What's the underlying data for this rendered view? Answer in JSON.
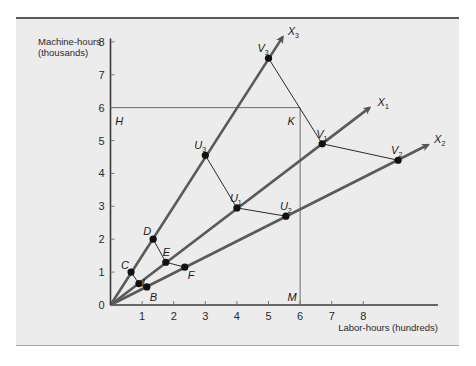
{
  "chart_data": {
    "type": "line",
    "title": "",
    "xlabel": "Labor-hours (hundreds)",
    "ylabel": "Machine-hours (thousands)",
    "ylabel_line1": "Machine-hours",
    "ylabel_line2": "(thousands)",
    "xlim": [
      0,
      10.5
    ],
    "ylim": [
      0,
      8
    ],
    "x_ticks": [
      1,
      2,
      3,
      4,
      5,
      6,
      7,
      8
    ],
    "y_ticks": [
      0,
      1,
      2,
      3,
      4,
      5,
      6,
      7,
      8
    ],
    "grid": false,
    "rays": [
      {
        "name": "X1",
        "label": "X",
        "sub": "1",
        "from": [
          0,
          0
        ],
        "to": [
          8.2,
          6.0
        ]
      },
      {
        "name": "X2",
        "label": "X",
        "sub": "2",
        "from": [
          0,
          0
        ],
        "to": [
          10.05,
          4.87
        ]
      },
      {
        "name": "X3",
        "label": "X",
        "sub": "3",
        "from": [
          0,
          0
        ],
        "to": [
          5.45,
          8.15
        ]
      }
    ],
    "points": [
      {
        "name": "C",
        "label": "C",
        "sub": "",
        "x": 0.65,
        "y": 1.0
      },
      {
        "name": "L",
        "label": "L",
        "sub": "",
        "x": 0.9,
        "y": 0.65
      },
      {
        "name": "B",
        "label": "B",
        "sub": "",
        "x": 1.15,
        "y": 0.55
      },
      {
        "name": "D",
        "label": "D",
        "sub": "",
        "x": 1.35,
        "y": 2.0
      },
      {
        "name": "E",
        "label": "E",
        "sub": "",
        "x": 1.75,
        "y": 1.3
      },
      {
        "name": "F",
        "label": "F",
        "sub": "",
        "x": 2.35,
        "y": 1.15
      },
      {
        "name": "U3",
        "label": "U",
        "sub": "3",
        "x": 3.0,
        "y": 4.55
      },
      {
        "name": "U1",
        "label": "U",
        "sub": "1",
        "x": 4.0,
        "y": 2.95
      },
      {
        "name": "U2",
        "label": "U",
        "sub": "2",
        "x": 5.55,
        "y": 2.7
      },
      {
        "name": "V3",
        "label": "V",
        "sub": "3",
        "x": 5.0,
        "y": 7.5
      },
      {
        "name": "V1",
        "label": "V",
        "sub": "1",
        "x": 6.7,
        "y": 4.9
      },
      {
        "name": "V2",
        "label": "V",
        "sub": "2",
        "x": 9.1,
        "y": 4.4
      }
    ],
    "isoquants": [
      {
        "name": "CLB",
        "through": [
          "C",
          "L",
          "B"
        ]
      },
      {
        "name": "DEF",
        "through": [
          "D",
          "E",
          "F"
        ]
      },
      {
        "name": "U3U1U2",
        "through": [
          "U3",
          "U1",
          "U2"
        ]
      },
      {
        "name": "V3V1V2",
        "through": [
          "V3",
          "V1",
          "V2"
        ]
      }
    ],
    "constraint_lines": [
      {
        "name": "HK",
        "from": [
          0,
          6
        ],
        "to": [
          6,
          6
        ]
      },
      {
        "name": "KM",
        "from": [
          6,
          6
        ],
        "to": [
          6,
          0
        ]
      }
    ],
    "annotations": [
      {
        "text": "H",
        "x": 0.15,
        "y": 5.6
      },
      {
        "text": "K",
        "x": 5.6,
        "y": 5.6
      },
      {
        "text": "M",
        "x": 5.6,
        "y": 0.25
      }
    ]
  }
}
